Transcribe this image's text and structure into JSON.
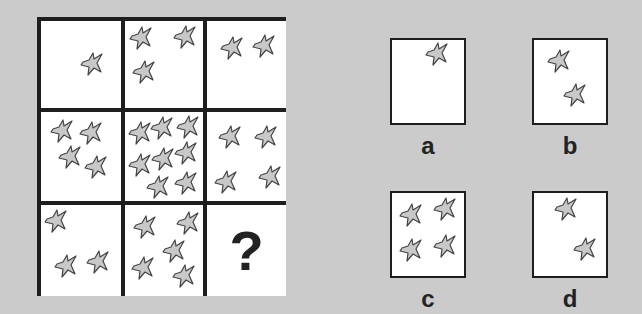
{
  "puzzle": {
    "type": "3x3 matrix completion",
    "shape": "irregular 5-pointed star",
    "colors": {
      "background": "#cbcbcb",
      "grid_border": "#1e1e1e",
      "star_fill": "#c8c8c8",
      "star_stroke": "#444444"
    },
    "grid": {
      "rows": [
        [
          {
            "count": 1
          },
          {
            "count": 3
          },
          {
            "count": 2
          }
        ],
        [
          {
            "count": 4
          },
          {
            "count": 9
          },
          {
            "count": 4
          }
        ],
        [
          {
            "count": 3
          },
          {
            "count": 6
          },
          {
            "missing": true,
            "label": "?"
          }
        ]
      ]
    },
    "options": [
      {
        "label": "a",
        "count": 1
      },
      {
        "label": "b",
        "count": 2
      },
      {
        "label": "c",
        "count": 4
      },
      {
        "label": "d",
        "count": 2
      }
    ]
  }
}
